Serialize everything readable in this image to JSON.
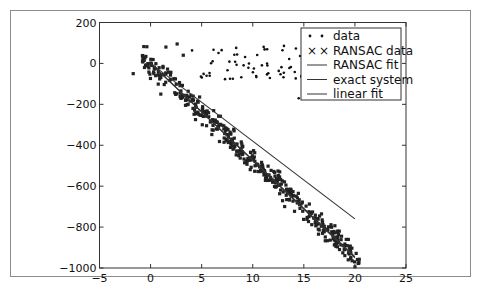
{
  "chart_data": {
    "type": "scatter",
    "title": "",
    "xlabel": "",
    "ylabel": "",
    "xlim": [
      -5,
      25
    ],
    "ylim": [
      -1000,
      200
    ],
    "x_ticks": [
      "−5",
      "0",
      "5",
      "10",
      "15",
      "20",
      "25"
    ],
    "y_ticks": [
      "200",
      "0",
      "−200",
      "−400",
      "−600",
      "−800",
      "−1000"
    ],
    "grid": false,
    "legend_position": "upper right",
    "legend": [
      {
        "label": "data",
        "marker": "dot"
      },
      {
        "label": "RANSAC data",
        "marker": "x"
      },
      {
        "label": "RANSAC fit",
        "marker": "line"
      },
      {
        "label": "exact system",
        "marker": "line"
      },
      {
        "label": "linear fit",
        "marker": "line"
      }
    ],
    "series": [
      {
        "name": "data",
        "kind": "scatter",
        "note": "outliers roughly x in [2,20], y in [-170,100]"
      },
      {
        "name": "RANSAC data",
        "kind": "scatter",
        "note": "inliers along y ≈ -47.5x, x in [-1,20.5] with noise ±80"
      },
      {
        "name": "RANSAC fit",
        "kind": "line",
        "x": [
          0,
          20
        ],
        "y": [
          0,
          -950
        ]
      },
      {
        "name": "exact system",
        "kind": "line",
        "x": [
          0,
          20
        ],
        "y": [
          0,
          -945
        ]
      },
      {
        "name": "linear fit",
        "kind": "line",
        "x": [
          0,
          20
        ],
        "y": [
          0,
          -760
        ]
      }
    ]
  }
}
